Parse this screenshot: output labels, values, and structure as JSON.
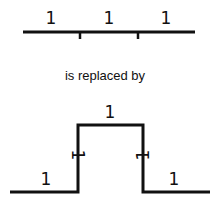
{
  "top_segments": [
    "1",
    "1",
    "1"
  ],
  "caption": "is replaced by",
  "bottom_segments": {
    "left": "1",
    "up": "1",
    "top": "1",
    "down": "1",
    "right": "1"
  },
  "colors": {
    "line": "#111111",
    "background": "#ffffff"
  }
}
